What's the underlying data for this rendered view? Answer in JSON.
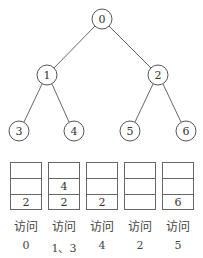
{
  "tree": {
    "nodes": [
      {
        "id": "0",
        "x": 102,
        "y": 19
      },
      {
        "id": "1",
        "x": 47,
        "y": 75
      },
      {
        "id": "2",
        "x": 158,
        "y": 75
      },
      {
        "id": "3",
        "x": 19,
        "y": 131
      },
      {
        "id": "4",
        "x": 74,
        "y": 131
      },
      {
        "id": "5",
        "x": 130,
        "y": 131
      },
      {
        "id": "6",
        "x": 186,
        "y": 131
      }
    ],
    "edges": [
      [
        "0",
        "1"
      ],
      [
        "0",
        "2"
      ],
      [
        "1",
        "3"
      ],
      [
        "1",
        "4"
      ],
      [
        "2",
        "5"
      ],
      [
        "2",
        "6"
      ]
    ]
  },
  "stacks": [
    {
      "cells": [
        "",
        "",
        "2"
      ],
      "action": "访问",
      "visited": "0"
    },
    {
      "cells": [
        "",
        "4",
        "2"
      ],
      "action": "访问",
      "visited": "1、3"
    },
    {
      "cells": [
        "",
        "",
        "2"
      ],
      "action": "访问",
      "visited": "4"
    },
    {
      "cells": [
        "",
        "",
        ""
      ],
      "action": "访问",
      "visited": "2"
    },
    {
      "cells": [
        "",
        "",
        "6"
      ],
      "action": "访问",
      "visited": "5"
    }
  ]
}
